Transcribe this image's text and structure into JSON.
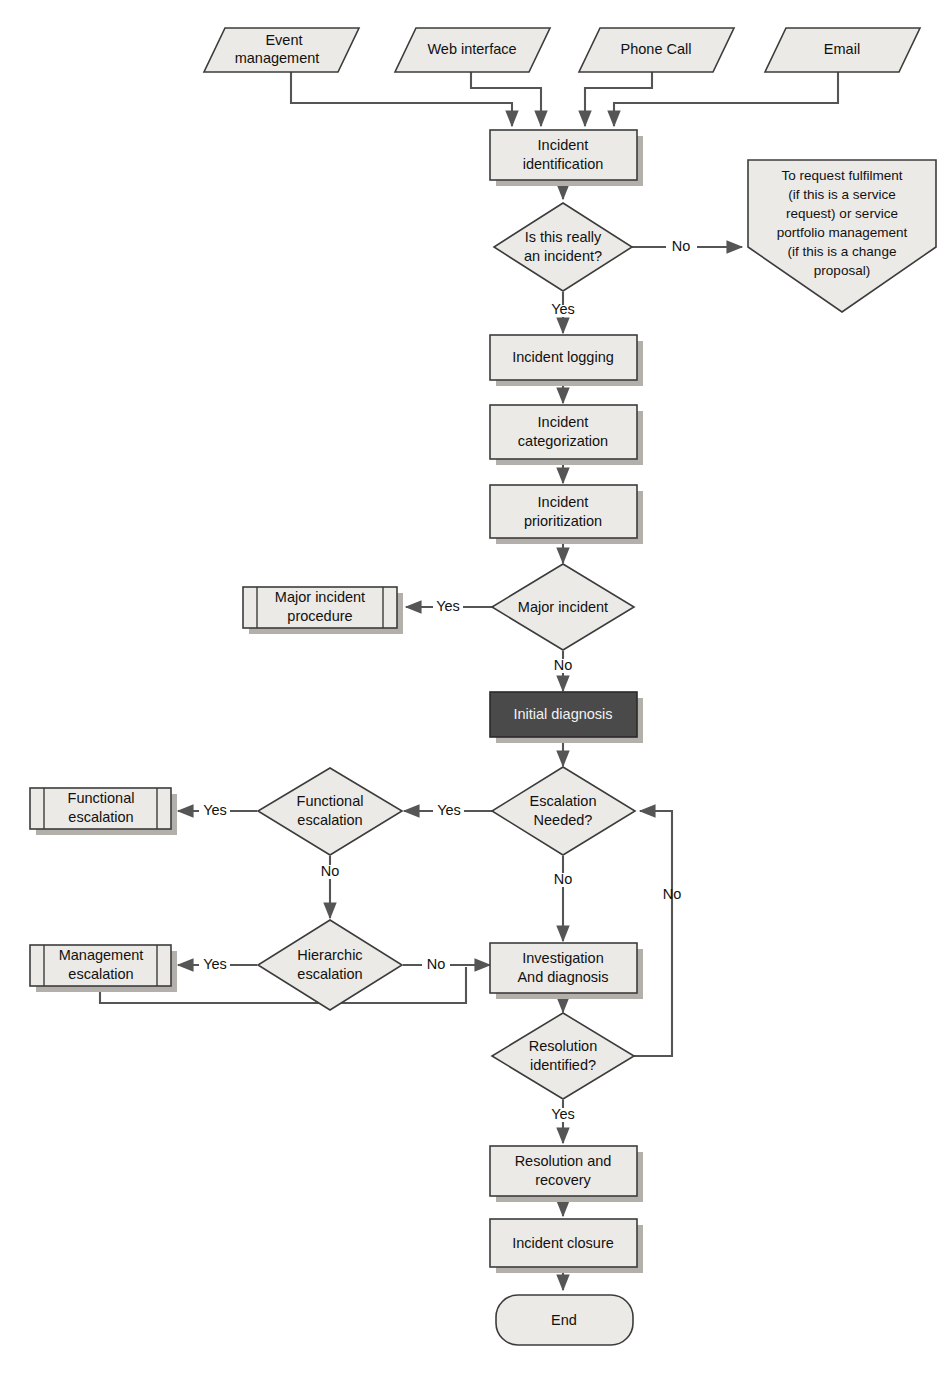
{
  "diagram": {
    "colors": {
      "node_fill": "#eceae6",
      "node_stroke": "#3c3c3c",
      "node_shadow": "#b3b0ab",
      "highlight_fill": "#4a4a4a",
      "highlight_text": "#f2f2f2",
      "edge_stroke": "#555555",
      "background": "#ffffff"
    },
    "nodes": [
      {
        "id": "event-management",
        "label": "Event\nmanagement",
        "shape": "parallelogram"
      },
      {
        "id": "web-interface",
        "label": "Web interface",
        "shape": "parallelogram"
      },
      {
        "id": "phone-call",
        "label": "Phone Call",
        "shape": "parallelogram"
      },
      {
        "id": "email",
        "label": "Email",
        "shape": "parallelogram"
      },
      {
        "id": "incident-identification",
        "label": "Incident\nidentification",
        "shape": "process"
      },
      {
        "id": "is-this-really-an-incident",
        "label": "Is this really\nan incident?",
        "shape": "decision"
      },
      {
        "id": "to-request-fulfilment",
        "label": "To request fulfilment\n(if this is a service\nrequest) or service\nportfolio management\n(if this is a change\nproposal)",
        "shape": "pentagon"
      },
      {
        "id": "incident-logging",
        "label": "Incident logging",
        "shape": "process"
      },
      {
        "id": "incident-categorization",
        "label": "Incident\ncategorization",
        "shape": "process"
      },
      {
        "id": "incident-prioritization",
        "label": "Incident\nprioritization",
        "shape": "process"
      },
      {
        "id": "major-incident",
        "label": "Major incident",
        "shape": "decision"
      },
      {
        "id": "major-incident-procedure",
        "label": "Major incident\nprocedure",
        "shape": "predefined-process"
      },
      {
        "id": "initial-diagnosis",
        "label": "Initial diagnosis",
        "shape": "process-highlighted"
      },
      {
        "id": "escalation-needed",
        "label": "Escalation\nNeeded?",
        "shape": "decision"
      },
      {
        "id": "functional-escalation-decision",
        "label": "Functional\nescalation",
        "shape": "decision"
      },
      {
        "id": "functional-escalation-process",
        "label": "Functional\nescalation",
        "shape": "predefined-process"
      },
      {
        "id": "hierarchic-escalation-decision",
        "label": "Hierarchic\nescalation",
        "shape": "decision"
      },
      {
        "id": "management-escalation-process",
        "label": "Management\nescalation",
        "shape": "predefined-process"
      },
      {
        "id": "investigation-and-diagnosis",
        "label": "Investigation\nAnd diagnosis",
        "shape": "process"
      },
      {
        "id": "resolution-identified",
        "label": "Resolution\nidentified?",
        "shape": "decision"
      },
      {
        "id": "resolution-and-recovery",
        "label": "Resolution and\nrecovery",
        "shape": "process"
      },
      {
        "id": "incident-closure",
        "label": "Incident closure",
        "shape": "process"
      },
      {
        "id": "end",
        "label": "End",
        "shape": "terminator"
      }
    ],
    "edge_labels": {
      "incident_no": "No",
      "incident_yes": "Yes",
      "major_yes": "Yes",
      "major_no": "No",
      "escalation_yes": "Yes",
      "escalation_no": "No",
      "functional_yes": "Yes",
      "functional_no": "No",
      "hierarchic_yes": "Yes",
      "hierarchic_no": "No",
      "resolution_no": "No",
      "resolution_yes": "Yes"
    },
    "labels": {
      "event_management_l1": "Event",
      "event_management_l2": "management",
      "web_interface": "Web interface",
      "phone_call": "Phone Call",
      "email": "Email",
      "incident_identification_l1": "Incident",
      "incident_identification_l2": "identification",
      "is_incident_l1": "Is this really",
      "is_incident_l2": "an incident?",
      "fulfilment_l1": "To request fulfilment",
      "fulfilment_l2": "(if this is a service",
      "fulfilment_l3": "request) or service",
      "fulfilment_l4": "portfolio management",
      "fulfilment_l5": "(if this is a change",
      "fulfilment_l6": "proposal)",
      "incident_logging": "Incident logging",
      "incident_categorization_l1": "Incident",
      "incident_categorization_l2": "categorization",
      "incident_prioritization_l1": "Incident",
      "incident_prioritization_l2": "prioritization",
      "major_incident": "Major incident",
      "major_incident_procedure_l1": "Major incident",
      "major_incident_procedure_l2": "procedure",
      "initial_diagnosis": "Initial diagnosis",
      "escalation_needed_l1": "Escalation",
      "escalation_needed_l2": "Needed?",
      "functional_escalation_d_l1": "Functional",
      "functional_escalation_d_l2": "escalation",
      "functional_escalation_p_l1": "Functional",
      "functional_escalation_p_l2": "escalation",
      "hierarchic_escalation_l1": "Hierarchic",
      "hierarchic_escalation_l2": "escalation",
      "management_escalation_l1": "Management",
      "management_escalation_l2": "escalation",
      "investigation_l1": "Investigation",
      "investigation_l2": "And diagnosis",
      "resolution_identified_l1": "Resolution",
      "resolution_identified_l2": "identified?",
      "resolution_recovery_l1": "Resolution and",
      "resolution_recovery_l2": "recovery",
      "incident_closure": "Incident closure",
      "end": "End"
    }
  }
}
